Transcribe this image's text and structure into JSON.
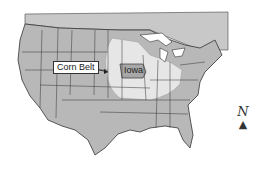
{
  "map": {
    "region": "Contiguous United States",
    "labels": {
      "corn_belt": "Corn Belt",
      "iowa": "Iowa"
    },
    "compass": {
      "letter": "N",
      "arrow": "▲"
    },
    "colors": {
      "background": "#ffffff",
      "state_fill": "#b8b8b8",
      "corn_belt_fill": "#e6e6e6",
      "iowa_fill": "#a8a8a8",
      "border": "#333333",
      "canada_fill": "#c8c8c8"
    }
  }
}
